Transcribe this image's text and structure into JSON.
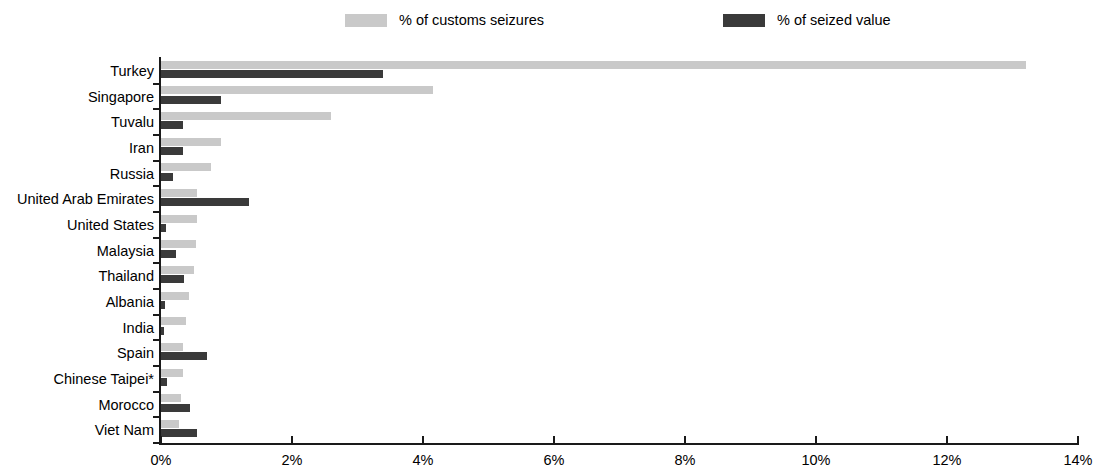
{
  "legend": {
    "items": [
      {
        "label": "% of customs seizures",
        "color": "#c9c9c9",
        "key": "seizures"
      },
      {
        "label": "% of seized value",
        "color": "#3a3a3a",
        "key": "value"
      }
    ]
  },
  "axis": {
    "x_ticks": [
      "0%",
      "2%",
      "4%",
      "6%",
      "8%",
      "10%",
      "12%",
      "14%"
    ],
    "x_tick_values": [
      0,
      2,
      4,
      6,
      8,
      10,
      12,
      14
    ],
    "x_min": 0,
    "x_max": 14
  },
  "chart_data": {
    "type": "bar",
    "orientation": "horizontal",
    "title": "",
    "subtitle": "",
    "xlabel": "",
    "ylabel": "",
    "xlim": [
      0,
      14
    ],
    "grid": false,
    "legend_position": "top",
    "categories": [
      "Turkey",
      "Singapore",
      "Tuvalu",
      "Iran",
      "Russia",
      "United Arab Emirates",
      "United States",
      "Malaysia",
      "Thailand",
      "Albania",
      "India",
      "Spain",
      "Chinese Taipei*",
      "Morocco",
      "Viet Nam"
    ],
    "series": [
      {
        "name": "% of customs seizures",
        "color": "#c9c9c9",
        "values": [
          13.2,
          4.16,
          2.59,
          0.92,
          0.76,
          0.55,
          0.55,
          0.53,
          0.5,
          0.42,
          0.38,
          0.33,
          0.33,
          0.3,
          0.28
        ]
      },
      {
        "name": "% of seized value",
        "color": "#3a3a3a",
        "values": [
          3.39,
          0.92,
          0.34,
          0.34,
          0.18,
          1.34,
          0.07,
          0.23,
          0.35,
          0.06,
          0.05,
          0.7,
          0.09,
          0.44,
          0.55
        ]
      }
    ],
    "tick_labels": [
      "0%",
      "2%",
      "4%",
      "6%",
      "8%",
      "10%",
      "12%",
      "14%"
    ]
  },
  "footnote": ""
}
